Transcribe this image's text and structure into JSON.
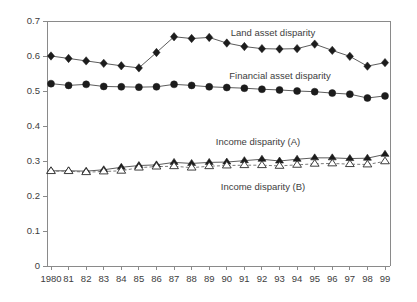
{
  "chart_data": {
    "type": "line",
    "title": "",
    "xlabel": "",
    "ylabel": "",
    "ylim": [
      0,
      0.7
    ],
    "ytick_labels": [
      "0",
      "0.1",
      "0.2",
      "0.3",
      "0.4",
      "0.5",
      "0.6",
      "0.7"
    ],
    "ytick_values": [
      0,
      0.1,
      0.2,
      0.3,
      0.4,
      0.5,
      0.6,
      0.7
    ],
    "grid": false,
    "legend_position": "inline-annotations",
    "categories": [
      "1980",
      "81",
      "82",
      "83",
      "84",
      "85",
      "86",
      "87",
      "88",
      "89",
      "90",
      "91",
      "92",
      "93",
      "94",
      "95",
      "96",
      "97",
      "98",
      "99"
    ],
    "x": [
      1980,
      1981,
      1982,
      1983,
      1984,
      1985,
      1986,
      1987,
      1988,
      1989,
      1990,
      1991,
      1992,
      1993,
      1994,
      1995,
      1996,
      1997,
      1998,
      1999
    ],
    "series": [
      {
        "name": "Land asset disparity",
        "marker": "diamond",
        "line": "solid",
        "values": [
          0.6,
          0.593,
          0.586,
          0.579,
          0.572,
          0.566,
          0.61,
          0.655,
          0.65,
          0.653,
          0.637,
          0.627,
          0.621,
          0.62,
          0.621,
          0.634,
          0.616,
          0.599,
          0.571,
          0.581
        ]
      },
      {
        "name": "Financial asset disparity",
        "marker": "circle",
        "line": "solid",
        "values": [
          0.521,
          0.516,
          0.519,
          0.513,
          0.512,
          0.511,
          0.512,
          0.519,
          0.516,
          0.512,
          0.51,
          0.508,
          0.505,
          0.503,
          0.5,
          0.498,
          0.494,
          0.491,
          0.48,
          0.486
        ]
      },
      {
        "name": "Income disparity (A)",
        "marker": "triangle-filled",
        "line": "solid",
        "values": [
          0.272,
          0.272,
          0.271,
          0.275,
          0.282,
          0.287,
          0.289,
          0.296,
          0.293,
          0.296,
          0.297,
          0.301,
          0.305,
          0.3,
          0.305,
          0.309,
          0.309,
          0.307,
          0.308,
          0.319
        ]
      },
      {
        "name": "Income disparity (B)",
        "marker": "triangle-open",
        "line": "dashed",
        "values": [
          0.271,
          0.271,
          0.268,
          0.27,
          0.272,
          0.281,
          0.284,
          0.285,
          0.281,
          0.285,
          0.287,
          0.288,
          0.288,
          0.286,
          0.289,
          0.292,
          0.293,
          0.291,
          0.29,
          0.299
        ]
      }
    ],
    "annotations": [
      {
        "text": "Land asset disparity",
        "x_pos": 273,
        "y_pos": 36
      },
      {
        "text": "Financial asset disparity",
        "x_pos": 280,
        "y_pos": 79
      },
      {
        "text": "Income disparity (A)",
        "x_pos": 258,
        "y_pos": 145
      },
      {
        "text": "Income disparity (B)",
        "x_pos": 263,
        "y_pos": 190
      }
    ]
  }
}
